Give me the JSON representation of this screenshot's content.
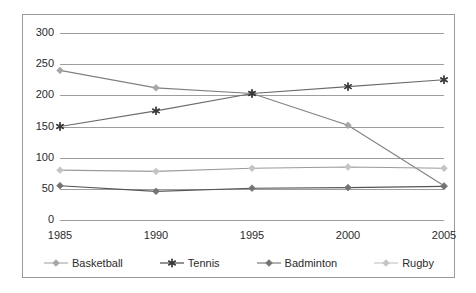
{
  "chart_data": {
    "type": "line",
    "title": "",
    "subtitle": "",
    "xlabel": "",
    "ylabel": "",
    "categories": [
      "1985",
      "1990",
      "1995",
      "2000",
      "2005"
    ],
    "x": [
      1985,
      1990,
      1995,
      2000,
      2005
    ],
    "ylim": [
      0,
      300
    ],
    "yticks": [
      0,
      50,
      100,
      150,
      200,
      250,
      300
    ],
    "ytick_labels": [
      "0",
      "50",
      "100",
      "150",
      "200",
      "250",
      "300"
    ],
    "grid": "horizontal",
    "legend_position": "bottom",
    "series": [
      {
        "name": "Basketball",
        "marker": "diamond",
        "color": "#a6a6a6",
        "line_color": "#808080",
        "values": [
          240,
          212,
          203,
          152,
          55
        ]
      },
      {
        "name": "Tennis",
        "marker": "asterisk",
        "color": "#3a3a3a",
        "line_color": "#6b6b6b",
        "values": [
          150,
          175,
          203,
          214,
          225
        ]
      },
      {
        "name": "Badminton",
        "marker": "diamond",
        "color": "#737373",
        "line_color": "#555555",
        "values": [
          55,
          46,
          51,
          52,
          54
        ]
      },
      {
        "name": "Rugby",
        "marker": "diamond",
        "color": "#c4c4c4",
        "line_color": "#9b9b9b",
        "values": [
          80,
          78,
          83,
          85,
          83
        ]
      }
    ]
  },
  "axes": {
    "y_tick_labels": [
      "300",
      "250",
      "200",
      "150",
      "100",
      "50",
      "0"
    ],
    "x_tick_labels": [
      "1985",
      "1990",
      "1995",
      "2000",
      "2005"
    ]
  },
  "legend": {
    "items": [
      {
        "label": "Basketball",
        "marker": "diamond",
        "color": "#a6a6a6"
      },
      {
        "label": "Tennis",
        "marker": "asterisk",
        "color": "#3a3a3a"
      },
      {
        "label": "Badminton",
        "marker": "diamond",
        "color": "#737373"
      },
      {
        "label": "Rugby",
        "marker": "diamond",
        "color": "#c4c4c4"
      }
    ]
  },
  "colors": {
    "grid": "#9d9d9d",
    "frame": "#9a9a9a",
    "text": "#2b2b2b",
    "background": "#ffffff"
  }
}
